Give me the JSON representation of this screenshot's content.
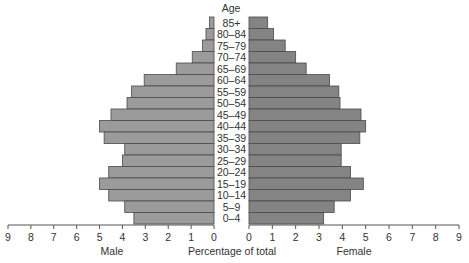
{
  "chart_data": {
    "type": "bar",
    "subtype": "population-pyramid",
    "title": "",
    "age_label": "Age",
    "xlabel": "Percentage of total",
    "left_label": "Male",
    "right_label": "Female",
    "categories": [
      "85+",
      "80–84",
      "75–79",
      "70–74",
      "65–69",
      "60–64",
      "55–59",
      "50–54",
      "45–49",
      "40–44",
      "35–39",
      "30–34",
      "25–29",
      "20–24",
      "15–19",
      "10–14",
      "5–9",
      "0–4"
    ],
    "series": [
      {
        "name": "Male",
        "color": "#9b9b9b",
        "values": [
          0.2,
          0.35,
          0.5,
          0.95,
          1.65,
          3.05,
          3.6,
          3.8,
          4.5,
          5.0,
          4.8,
          3.9,
          4.0,
          4.6,
          5.0,
          4.6,
          3.9,
          3.5
        ]
      },
      {
        "name": "Female",
        "color": "#848484",
        "values": [
          0.8,
          1.05,
          1.55,
          2.0,
          2.45,
          3.45,
          3.85,
          3.9,
          4.8,
          5.0,
          4.75,
          3.95,
          3.95,
          4.35,
          4.9,
          4.35,
          3.65,
          3.2
        ]
      }
    ],
    "xlim": [
      0,
      9
    ],
    "ticks": [
      "0",
      "1",
      "2",
      "3",
      "4",
      "5",
      "6",
      "7",
      "8",
      "9"
    ],
    "grid": false,
    "legend": "none"
  }
}
